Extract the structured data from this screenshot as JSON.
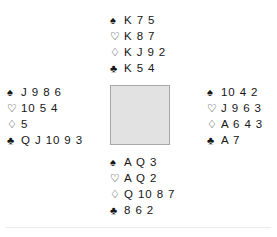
{
  "diagram": {
    "type": "bridge-deal-diagram",
    "suit_symbols": {
      "spades": "♠",
      "hearts": "♡",
      "diamonds": "♢",
      "clubs": "♣"
    },
    "colors": {
      "text": "#161616",
      "center_box_fill": "#e2e2e2",
      "center_box_border": "#a8a8a8",
      "rule": "#ebebeb",
      "background": "#ffffff"
    },
    "hands": {
      "north": {
        "position_label": "North",
        "rows": [
          {
            "suit": "spades",
            "symbol": "♠",
            "holding": "K 7 5"
          },
          {
            "suit": "hearts",
            "symbol": "♡",
            "holding": "K 8 7"
          },
          {
            "suit": "diamonds",
            "symbol": "♢",
            "holding": "K J 9 2"
          },
          {
            "suit": "clubs",
            "symbol": "♣",
            "holding": "K 5 4"
          }
        ]
      },
      "west": {
        "position_label": "West",
        "rows": [
          {
            "suit": "spades",
            "symbol": "♠",
            "holding": "J 9 8 6"
          },
          {
            "suit": "hearts",
            "symbol": "♡",
            "holding": "10 5 4"
          },
          {
            "suit": "diamonds",
            "symbol": "♢",
            "holding": "5"
          },
          {
            "suit": "clubs",
            "symbol": "♣",
            "holding": "Q J 10 9 3"
          }
        ]
      },
      "east": {
        "position_label": "East",
        "rows": [
          {
            "suit": "spades",
            "symbol": "♠",
            "holding": "10 4 2"
          },
          {
            "suit": "hearts",
            "symbol": "♡",
            "holding": "J 9 6 3"
          },
          {
            "suit": "diamonds",
            "symbol": "♢",
            "holding": "A 6 4 3"
          },
          {
            "suit": "clubs",
            "symbol": "♣",
            "holding": "A 7"
          }
        ]
      },
      "south": {
        "position_label": "South",
        "rows": [
          {
            "suit": "spades",
            "symbol": "♠",
            "holding": "A Q 3"
          },
          {
            "suit": "hearts",
            "symbol": "♡",
            "holding": "A Q 2"
          },
          {
            "suit": "diamonds",
            "symbol": "♢",
            "holding": "Q 10 8 7"
          },
          {
            "suit": "clubs",
            "symbol": "♣",
            "holding": "8 6 2"
          }
        ]
      }
    }
  }
}
